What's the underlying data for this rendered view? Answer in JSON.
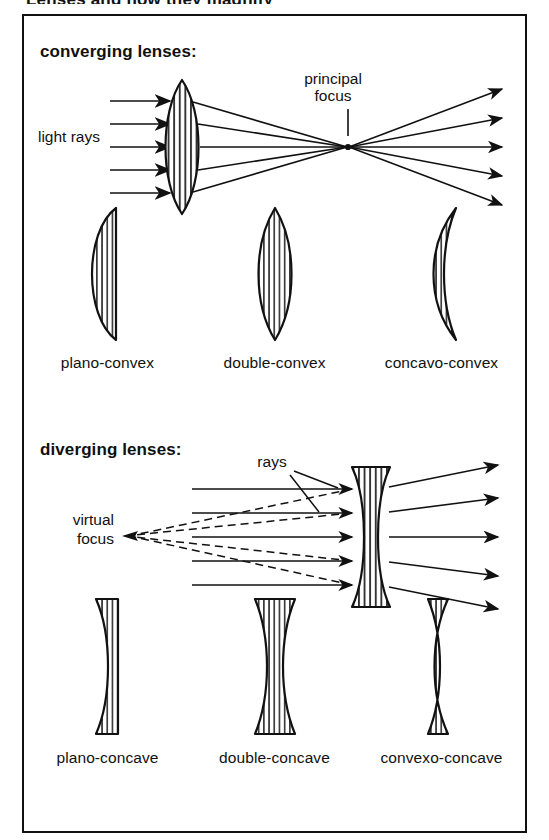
{
  "page": {
    "cropped_title": "Lenses and how they magnify",
    "background": "#ffffff",
    "ink_color": "#111111"
  },
  "sections": {
    "converging": {
      "heading": "converging lenses:",
      "ray_diagram": {
        "incoming_label": "light rays",
        "focus_label_line1": "principal",
        "focus_label_line2": "focus",
        "ray_count": 5,
        "lens_type": "double-convex",
        "description": "parallel rays refract through convex lens to a real principal focus then diverge"
      },
      "shapes": [
        {
          "id": "plano-convex",
          "label": "plano-convex"
        },
        {
          "id": "double-convex",
          "label": "double-convex"
        },
        {
          "id": "concavo-convex",
          "label": "concavo-convex"
        }
      ]
    },
    "diverging": {
      "heading": "diverging lenses:",
      "ray_diagram": {
        "incoming_label_line1": "light",
        "incoming_label_line2": "rays",
        "focus_label_line1": "virtual",
        "focus_label_line2": "focus",
        "ray_count": 5,
        "lens_type": "double-concave",
        "description": "parallel rays refract through concave lens and diverge; dashed back-projections meet at virtual focus"
      },
      "shapes": [
        {
          "id": "plano-concave",
          "label": "plano-concave"
        },
        {
          "id": "double-concave",
          "label": "double-concave"
        },
        {
          "id": "convexo-concave",
          "label": "convexo-concave"
        }
      ]
    }
  }
}
